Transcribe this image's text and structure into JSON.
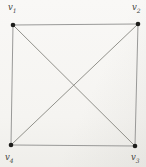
{
  "figure": {
    "type": "graph-diagram",
    "background_color": "#f6f5f2",
    "edge_color": "#8f8f8d",
    "diagonal_edge_color": "#86867f",
    "vertex_color": "#1d1d1b",
    "label_color": "#3e3e3c",
    "vertex_radius": 2.3,
    "edge_width": 0.9,
    "label_font_size": 8.5,
    "subscript_font_size": 6,
    "vertices": [
      {
        "id": "v1",
        "base": "v",
        "sub": "1",
        "x": 13,
        "y": 25,
        "lx": 8,
        "ly": 10
      },
      {
        "id": "v2",
        "base": "v",
        "sub": "2",
        "x": 138,
        "y": 24,
        "lx": 132,
        "ly": 10
      },
      {
        "id": "v3",
        "base": "v",
        "sub": "3",
        "x": 135,
        "y": 146,
        "lx": 131,
        "ly": 160
      },
      {
        "id": "v4",
        "base": "v",
        "sub": "4",
        "x": 11,
        "y": 145,
        "lx": 5,
        "ly": 160
      }
    ],
    "edges": [
      {
        "from": "v1",
        "to": "v2",
        "diagonal": false
      },
      {
        "from": "v2",
        "to": "v3",
        "diagonal": false
      },
      {
        "from": "v3",
        "to": "v4",
        "diagonal": false
      },
      {
        "from": "v4",
        "to": "v1",
        "diagonal": false
      },
      {
        "from": "v1",
        "to": "v3",
        "diagonal": true
      },
      {
        "from": "v2",
        "to": "v4",
        "diagonal": true
      }
    ]
  }
}
